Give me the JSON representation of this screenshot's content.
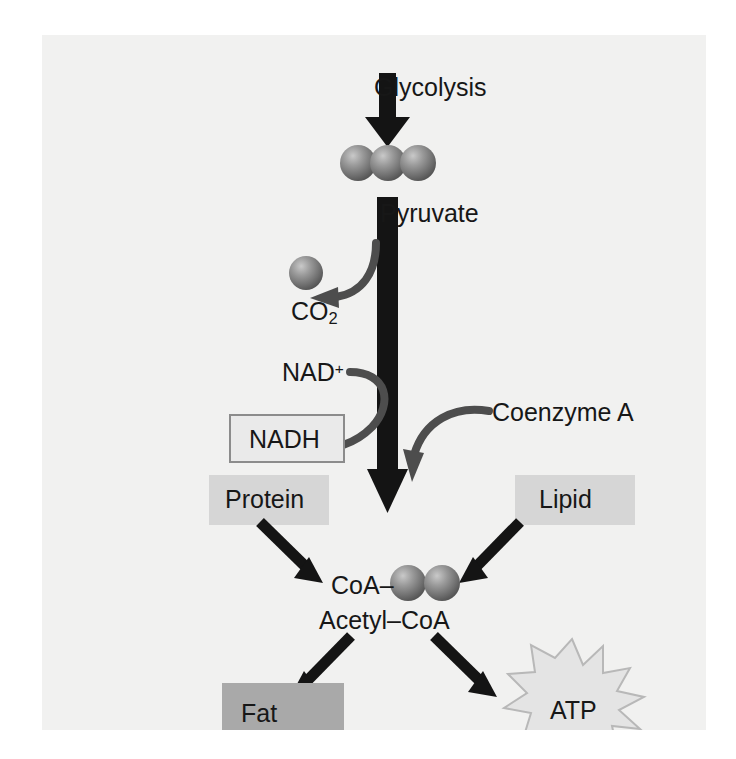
{
  "figure": {
    "background_color": "#f1f1f0",
    "ink_color": "#171717",
    "arrow_color": "#4d4d4d"
  },
  "nodes": {
    "glycolysis": {
      "label": "Glycolysis",
      "kind": "plain-text"
    },
    "pyruvate": {
      "label": "Pyruvate",
      "kind": "plain-text",
      "spheres": 3
    },
    "co2": {
      "label": "CO",
      "subscript": "2",
      "kind": "plain-text",
      "spheres": 1
    },
    "nad_plus": {
      "label": "NAD",
      "superscript": "+",
      "kind": "plain-text"
    },
    "nadh": {
      "label": "NADH",
      "kind": "outlined-box",
      "fill": "#eaeaea",
      "border": "#8c8c8c"
    },
    "coenzyme_a": {
      "label": "Coenzyme A",
      "kind": "plain-text"
    },
    "protein": {
      "label": "Protein",
      "kind": "filled-box",
      "fill": "#d6d6d6"
    },
    "lipid": {
      "label": "Lipid",
      "kind": "filled-box",
      "fill": "#d6d6d6"
    },
    "coa": {
      "label": "CoA–",
      "kind": "plain-text",
      "spheres": 2
    },
    "acetyl_coa": {
      "label": "Acetyl–CoA",
      "kind": "plain-text"
    },
    "fat": {
      "label": "Fat",
      "kind": "filled-box",
      "fill": "#a9a9a9"
    },
    "atp": {
      "label": "ATP",
      "kind": "starburst",
      "fill": "#e4e4e4",
      "border": "#b8b8b8",
      "points": 12
    }
  },
  "edges": [
    {
      "from": "glycolysis",
      "to": "pyruvate",
      "style": "thick-block-arrow"
    },
    {
      "from": "pyruvate",
      "to": "acetyl_coa",
      "style": "thick-block-arrow"
    },
    {
      "from": "pathway",
      "to": "co2",
      "style": "curved-arrow"
    },
    {
      "from": "nad_plus",
      "to": "nadh",
      "style": "curved-arrow"
    },
    {
      "from": "coenzyme_a",
      "to": "pathway",
      "style": "curved-arrow"
    },
    {
      "from": "protein",
      "to": "acetyl_coa",
      "style": "straight-arrow"
    },
    {
      "from": "lipid",
      "to": "acetyl_coa",
      "style": "straight-arrow"
    },
    {
      "from": "acetyl_coa",
      "to": "fat",
      "style": "straight-arrow"
    },
    {
      "from": "acetyl_coa",
      "to": "atp",
      "style": "straight-arrow"
    }
  ]
}
